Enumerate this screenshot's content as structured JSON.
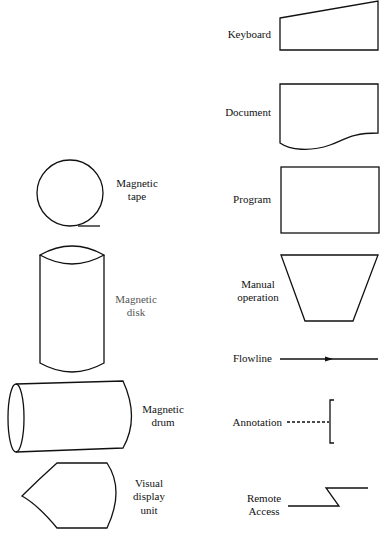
{
  "diagram": {
    "symbols": [
      {
        "id": "keyboard",
        "label_lines": [
          "Keyboard"
        ]
      },
      {
        "id": "document",
        "label_lines": [
          "Document"
        ]
      },
      {
        "id": "program",
        "label_lines": [
          "Program"
        ]
      },
      {
        "id": "manual-operation",
        "label_lines": [
          "Manual",
          "operation"
        ]
      },
      {
        "id": "flowline",
        "label_lines": [
          "Flowline"
        ]
      },
      {
        "id": "annotation",
        "label_lines": [
          "Annotation"
        ]
      },
      {
        "id": "remote-access",
        "label_lines": [
          "Remote",
          "Access"
        ]
      },
      {
        "id": "magnetic-tape",
        "label_lines": [
          "Magnetic",
          "tape"
        ]
      },
      {
        "id": "magnetic-disk",
        "label_lines": [
          "Magnetic",
          "disk"
        ]
      },
      {
        "id": "magnetic-drum",
        "label_lines": [
          "Magnetic",
          "drum"
        ]
      },
      {
        "id": "visual-display-unit",
        "label_lines": [
          "Visual",
          "display",
          "unit"
        ]
      }
    ]
  },
  "colors": {
    "stroke": "#111111",
    "background": "#ffffff"
  }
}
